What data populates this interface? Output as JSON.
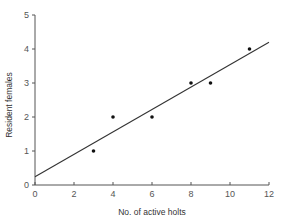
{
  "chart_data": {
    "type": "scatter",
    "title": "",
    "xlabel": "No. of active holts",
    "ylabel": "Resident females",
    "xlim": [
      0,
      12
    ],
    "ylim": [
      0,
      5
    ],
    "xticks": [
      0,
      2,
      4,
      6,
      8,
      10,
      12
    ],
    "yticks": [
      0,
      1,
      2,
      3,
      4,
      5
    ],
    "grid": false,
    "legend": null,
    "series": [
      {
        "name": "observations",
        "points": [
          {
            "x": 3,
            "y": 1
          },
          {
            "x": 4,
            "y": 2
          },
          {
            "x": 6,
            "y": 2
          },
          {
            "x": 8,
            "y": 3
          },
          {
            "x": 9,
            "y": 3
          },
          {
            "x": 11,
            "y": 4
          }
        ]
      }
    ],
    "fit_line": {
      "type": "linear",
      "from": {
        "x": 0,
        "y": 0.24
      },
      "to": {
        "x": 12,
        "y": 4.2
      }
    },
    "colors": {
      "axis": "#555555",
      "point": "#111111",
      "line": "#333333"
    }
  }
}
